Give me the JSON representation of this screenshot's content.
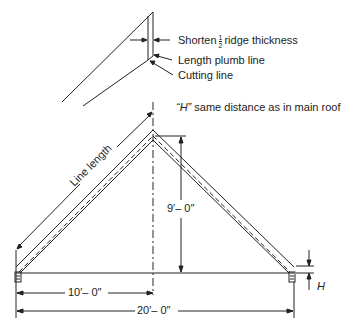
{
  "detail": {
    "shorten_prefix": "Shorten",
    "shorten_num": "1",
    "shorten_den": "2",
    "shorten_suffix": "ridge thickness",
    "length_plumb_line": "Length plumb line",
    "cutting_line": "Cutting line"
  },
  "note": {
    "h_quote": "“H”",
    "h_text": "same distance as in main roof"
  },
  "dimensions": {
    "line_length": "Line length",
    "rise": "9′– 0″",
    "half_span": "10′– 0″",
    "span": "20′– 0″",
    "h_label": "H"
  },
  "colors": {
    "line": "#222222",
    "background": "#ffffff"
  }
}
